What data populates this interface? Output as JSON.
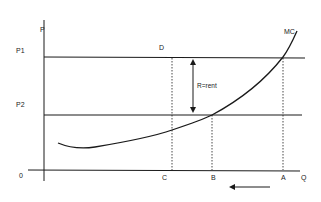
{
  "diagram": {
    "axes": {
      "y_label": "P",
      "x_label": "Q",
      "origin_label": "0"
    },
    "price_levels": [
      {
        "label": "P1",
        "y": 57
      },
      {
        "label": "P2",
        "y": 115
      }
    ],
    "curves": {
      "demand_label": "D",
      "mc_label": "MC"
    },
    "quantity_points": [
      {
        "label": "C",
        "x": 172
      },
      {
        "label": "B",
        "x": 212
      },
      {
        "label": "A",
        "x": 283
      }
    ],
    "annotation": {
      "rent_label": "R=rent"
    },
    "direction_arrow": "leftward",
    "colors": {
      "line": "#1a1a1a",
      "text": "#222222",
      "background": "#ffffff"
    }
  }
}
